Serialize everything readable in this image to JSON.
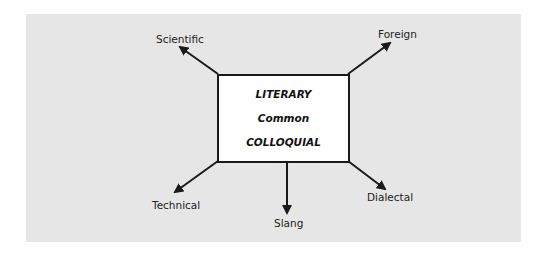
{
  "diagram": {
    "center_box": {
      "lines": [
        "LITERARY",
        "Common",
        "COLLOQUIAL"
      ]
    },
    "branches": [
      {
        "label": "Scientific",
        "direction": "up-left"
      },
      {
        "label": "Foreign",
        "direction": "up-right"
      },
      {
        "label": "Technical",
        "direction": "down-left"
      },
      {
        "label": "Slang",
        "direction": "down"
      },
      {
        "label": "Dialectal",
        "direction": "down-right"
      }
    ],
    "colors": {
      "background": "#e6e6e6",
      "box_fill": "#ffffff",
      "stroke": "#1a1a1a"
    }
  }
}
